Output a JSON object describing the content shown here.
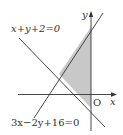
{
  "figure": {
    "type": "linear-inequality-region",
    "axes": {
      "x_label": "x",
      "y_label": "y",
      "origin_label": "O"
    },
    "lines": [
      {
        "id": "line1",
        "equation": "x+y+2=0"
      },
      {
        "id": "line2",
        "equation": "3x−2y+16=0"
      }
    ],
    "shaded_region": {
      "description": "Triangle bounded by x+y+2=0, 3x−2y+16=0 and the y-axis",
      "fill": "#c8c8c8"
    },
    "colors": {
      "stroke": "#333333",
      "shade": "#c8c8c8",
      "background": "#ffffff"
    }
  }
}
